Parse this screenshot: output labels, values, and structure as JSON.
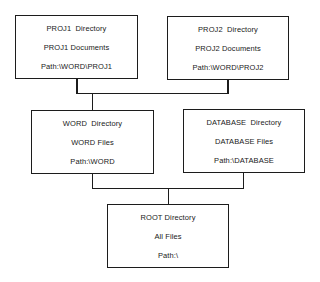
{
  "diagram": {
    "type": "directory-tree",
    "nodes": [
      {
        "id": "proj1",
        "title": "PROJ1  Directory",
        "contents": "PROJ1 Documents",
        "path": "Path:\\WORD\\PROJ1",
        "parent": "word"
      },
      {
        "id": "proj2",
        "title": "PROJ2  Directory",
        "contents": "PROJ2 Documents",
        "path": "Path:\\WORD\\PROJ2",
        "parent": "word"
      },
      {
        "id": "word",
        "title": "WORD  Directory",
        "contents": "WORD Files",
        "path": "Path:\\WORD",
        "parent": "root"
      },
      {
        "id": "database",
        "title": "DATABASE  Directory",
        "contents": "DATABASE Files",
        "path": "Path:\\DATABASE",
        "parent": "root"
      },
      {
        "id": "root",
        "title": "ROOT Directory",
        "contents": "All Files",
        "path": "Path:\\",
        "parent": null
      }
    ],
    "edges": [
      {
        "from": "proj1",
        "to": "word"
      },
      {
        "from": "proj2",
        "to": "word"
      },
      {
        "from": "word",
        "to": "root"
      },
      {
        "from": "database",
        "to": "root"
      }
    ]
  }
}
